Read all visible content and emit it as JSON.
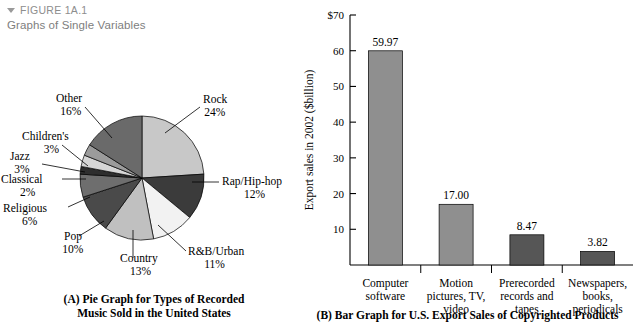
{
  "header": {
    "marker_icon": "triangle-down-icon",
    "figure_number": "FIGURE 1A.1",
    "figure_title": "Graphs of Single Variables"
  },
  "captions": {
    "panel_a_line1": "(A) Pie Graph for Types of Recorded",
    "panel_a_line2": "Music Sold in the United States",
    "panel_b": "(B) Bar Graph for U.S. Export Sales of Copyrighted Products"
  },
  "chart_data": [
    {
      "id": "panel-a",
      "type": "pie",
      "title": "(A) Pie Graph for Types of Recorded Music Sold in the United States",
      "xlabel": "",
      "ylabel": "",
      "legend": "none",
      "grid": false,
      "units": "percent",
      "categories": [
        "Rock",
        "Rap/Hip-hop",
        "R&B/Urban",
        "Country",
        "Pop",
        "Religious",
        "Classical",
        "Jazz",
        "Children's",
        "Other"
      ],
      "values": [
        24,
        12,
        11,
        13,
        10,
        6,
        2,
        3,
        3,
        16
      ],
      "slices": [
        {
          "label": "Rock",
          "value": 24,
          "value_text": "24%",
          "color": "#c8c8c8"
        },
        {
          "label": "Rap/Hip-hop",
          "value": 12,
          "value_text": "12%",
          "color": "#3b3b3b"
        },
        {
          "label": "R&B/Urban",
          "value": 11,
          "value_text": "11%",
          "color": "#f2f2f2"
        },
        {
          "label": "Country",
          "value": 13,
          "value_text": "13%",
          "color": "#c0c0c0"
        },
        {
          "label": "Pop",
          "value": 10,
          "value_text": "10%",
          "color": "#4a4a4a"
        },
        {
          "label": "Religious",
          "value": 6,
          "value_text": "6%",
          "color": "#6e6e6e"
        },
        {
          "label": "Classical",
          "value": 2,
          "value_text": "2%",
          "color": "#2e2e2e"
        },
        {
          "label": "Jazz",
          "value": 3,
          "value_text": "3%",
          "color": "#d6d6d6"
        },
        {
          "label": "Children's",
          "value": 3,
          "value_text": "3%",
          "color": "#9b9b9b"
        },
        {
          "label": "Other",
          "value": 16,
          "value_text": "16%",
          "color": "#6a6a6a"
        }
      ]
    },
    {
      "id": "panel-b",
      "type": "bar",
      "title": "(B) Bar Graph for U.S. Export Sales of Copyrighted Products",
      "ylabel": "Export sales in 2002 ($billion)",
      "xlabel": "",
      "legend": "none",
      "grid": false,
      "ylim": [
        0,
        70
      ],
      "yticks": [
        10,
        20,
        30,
        40,
        50,
        60,
        70
      ],
      "ytick_labels": [
        "10",
        "20",
        "30",
        "40",
        "50",
        "60",
        "$70"
      ],
      "categories": [
        [
          "Computer",
          "software"
        ],
        [
          "Motion",
          "pictures, TV,",
          "video"
        ],
        [
          "Prerecorded",
          "records and",
          "tapes"
        ],
        [
          "Newspapers,",
          "books,",
          "periodicals"
        ]
      ],
      "category_labels": [
        "Computer software",
        "Motion pictures, TV, video",
        "Prerecorded records and tapes",
        "Newspapers, books, periodicals"
      ],
      "values": [
        59.97,
        17.0,
        8.47,
        3.82
      ],
      "value_labels": [
        "59.97",
        "17.00",
        "8.47",
        "3.82"
      ],
      "bar_colors": [
        "#8f8f8f",
        "#8f8f8f",
        "#565656",
        "#565656"
      ]
    }
  ]
}
